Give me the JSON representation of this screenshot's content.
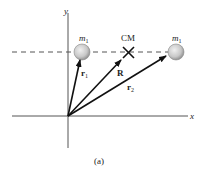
{
  "diagram": {
    "caption": "(a)",
    "axes": {
      "x_label": "x",
      "y_label": "y"
    },
    "masses": [
      {
        "label": "m",
        "subscript": "1",
        "position": "left"
      },
      {
        "label": "m",
        "subscript": "1",
        "position": "right"
      }
    ],
    "center_of_mass": {
      "label": "CM",
      "marker": "X"
    },
    "vectors": [
      {
        "label": "r",
        "subscript": "1",
        "target": "left mass"
      },
      {
        "label": "R",
        "subscript": "",
        "target": "CM"
      },
      {
        "label": "r",
        "subscript": "2",
        "target": "right mass"
      }
    ],
    "colors": {
      "axis": "#555555",
      "vector": "#111111",
      "mass_fill": "#cfcfcf",
      "dashed": "#555555"
    }
  }
}
